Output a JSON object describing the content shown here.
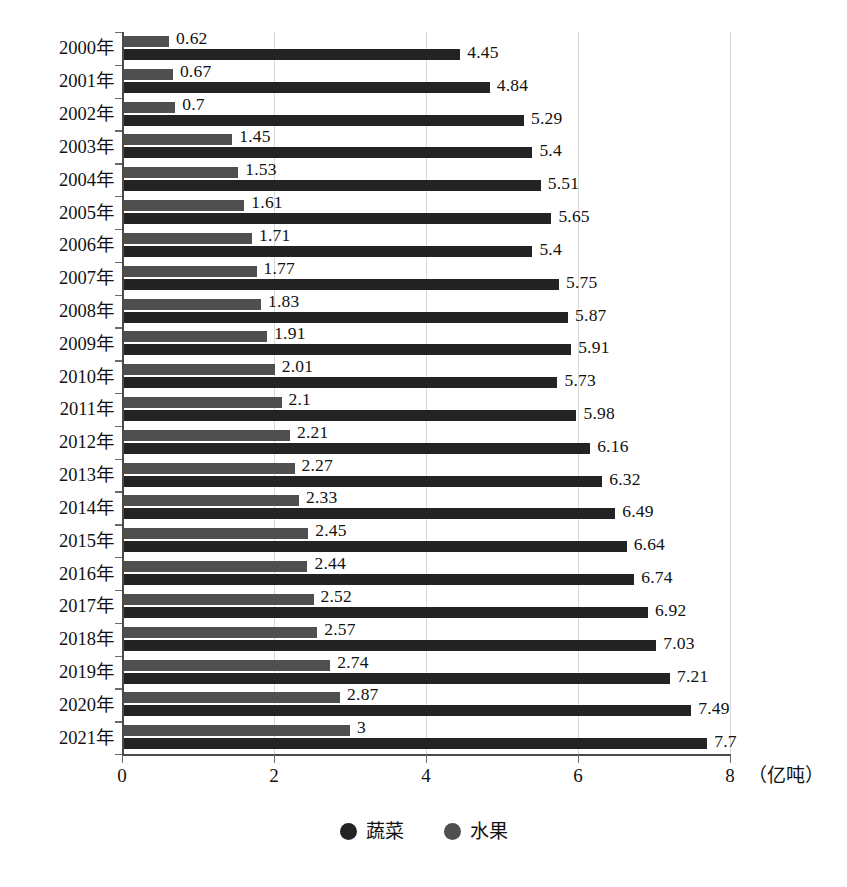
{
  "chart_data": {
    "type": "bar",
    "orientation": "horizontal",
    "title": "",
    "subtitle": "",
    "xlabel": "（亿吨）",
    "ylabel": "",
    "xlim": [
      0,
      8
    ],
    "xticks": [
      0,
      2,
      4,
      6,
      8
    ],
    "xtick_labels": [
      "0",
      "2",
      "4",
      "6",
      "8"
    ],
    "grid": true,
    "grid_axis": "x",
    "legend_position": "bottom-center",
    "categories": [
      "2000年",
      "2001年",
      "2002年",
      "2003年",
      "2004年",
      "2005年",
      "2006年",
      "2007年",
      "2008年",
      "2009年",
      "2010年",
      "2011年",
      "2012年",
      "2013年",
      "2014年",
      "2015年",
      "2016年",
      "2017年",
      "2018年",
      "2019年",
      "2020年",
      "2021年"
    ],
    "series": [
      {
        "name": "蔬菜",
        "color": "#232323",
        "values": [
          4.45,
          4.84,
          5.29,
          5.4,
          5.51,
          5.65,
          5.4,
          5.75,
          5.87,
          5.91,
          5.73,
          5.98,
          6.16,
          6.32,
          6.49,
          6.64,
          6.74,
          6.92,
          7.03,
          7.21,
          7.49,
          7.7
        ],
        "labels": [
          "4.45",
          "4.84",
          "5.29",
          "5.4",
          "5.51",
          "5.65",
          "5.4",
          "5.75",
          "5.87",
          "5.91",
          "5.73",
          "5.98",
          "6.16",
          "6.32",
          "6.49",
          "6.64",
          "6.74",
          "6.92",
          "7.03",
          "7.21",
          "7.49",
          "7.7"
        ]
      },
      {
        "name": "水果",
        "color": "#4f4f4f",
        "values": [
          0.62,
          0.67,
          0.7,
          1.45,
          1.53,
          1.61,
          1.71,
          1.77,
          1.83,
          1.91,
          2.01,
          2.1,
          2.21,
          2.27,
          2.33,
          2.45,
          2.44,
          2.52,
          2.57,
          2.74,
          2.87,
          3
        ],
        "labels": [
          "0.62",
          "0.67",
          "0.7",
          "1.45",
          "1.53",
          "1.61",
          "1.71",
          "1.77",
          "1.83",
          "1.91",
          "2.01",
          "2.1",
          "2.21",
          "2.27",
          "2.33",
          "2.45",
          "2.44",
          "2.52",
          "2.57",
          "2.74",
          "2.87",
          "3"
        ]
      }
    ]
  },
  "legend": {
    "items": [
      {
        "label": "蔬菜",
        "color": "#232323"
      },
      {
        "label": "水果",
        "color": "#4f4f4f"
      }
    ]
  },
  "axis": {
    "unit_label": "（亿吨）"
  }
}
